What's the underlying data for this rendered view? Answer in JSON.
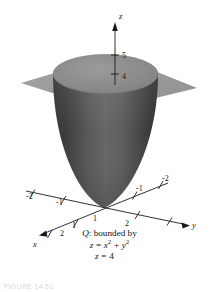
{
  "figure": {
    "title_axis_z": "z",
    "title_axis_x": "x",
    "title_axis_y": "y",
    "z_ticks": [
      "5",
      "4"
    ],
    "x_neg_ticks": [
      "-2",
      "-1"
    ],
    "x_pos_ticks": [
      "1",
      "2"
    ],
    "y_neg_ticks": [
      "-2",
      "-1"
    ],
    "y_pos_ticks": [
      "1",
      "2"
    ],
    "colors": {
      "plane": "#9a9a9a",
      "cap": "#8d8d8d",
      "surface_dark": "#3a3a3a",
      "surface_light": "#7b7b7b",
      "axis": "#1a1a1a",
      "background": "#ffffff"
    }
  },
  "caption": {
    "line1_label": "Q",
    "line1_text": ":  bounded by",
    "line2_lhs": "z",
    "line2_eq": " = ",
    "line2_term1_base": "x",
    "line2_term1_exp": "2",
    "line2_plus": " + ",
    "line2_term2_base": "y",
    "line2_term2_exp": "2",
    "line3_lhs": "z",
    "line3_eq": " = ",
    "line3_rhs": "4"
  },
  "figure_number": "FIGURE 14.51"
}
